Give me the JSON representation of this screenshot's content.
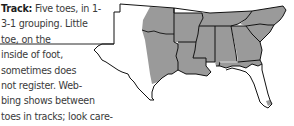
{
  "track": {
    "label": "Track:",
    "lines": [
      " Five toes, in 1-",
      "3-1 grouping. Little",
      "toe, on the",
      "inside of foot,",
      "sometimes does",
      "not register. Web-",
      "bing shows between",
      "toes in tracks; look care-",
      "fully. Interdigital pad chevron-"
    ]
  },
  "map": {
    "description": "Range map of southeastern United States",
    "range_color": "#9a9a9a",
    "outline_color": "#111111",
    "background_color": "#ffffff",
    "shaded_states": [
      "Oklahoma (east)",
      "Texas (east)",
      "Arkansas",
      "Louisiana",
      "Mississippi",
      "Alabama",
      "Georgia",
      "Tennessee",
      "South Carolina",
      "North Carolina",
      "Florida (panhandle)"
    ],
    "unshaded_states": [
      "Texas (west/central)",
      "Florida (peninsula)"
    ]
  }
}
